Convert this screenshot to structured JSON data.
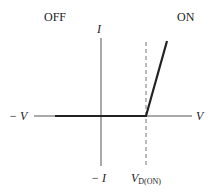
{
  "diagram": {
    "region_labels": {
      "off": "OFF",
      "on": "ON"
    },
    "axes": {
      "y_positive": "I",
      "y_negative": "− I",
      "x_positive": "V",
      "x_negative": "− V",
      "marker_main": "V",
      "marker_sub": "D(ON)"
    },
    "colors": {
      "axis": "#555555",
      "curve": "#222222",
      "dashed": "#777777"
    }
  }
}
